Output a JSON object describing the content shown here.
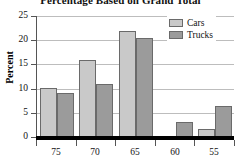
{
  "chart_data": {
    "type": "bar",
    "title": "Percentage Based on Grand Total",
    "xlabel": "",
    "ylabel": "Percent",
    "categories": [
      "75",
      "70",
      "65",
      "60",
      "55"
    ],
    "series": [
      {
        "name": "Cars",
        "color": "#c9c9c9",
        "values": [
          10.2,
          16.0,
          21.8,
          0.0,
          1.7
        ]
      },
      {
        "name": "Trucks",
        "color": "#9b9b9b",
        "values": [
          9.0,
          11.0,
          20.4,
          3.1,
          6.4
        ]
      }
    ],
    "ylim": [
      0,
      25
    ],
    "yticks": [
      0,
      5,
      10,
      15,
      20,
      25
    ],
    "ytick_labels": [
      "0",
      "5",
      "10",
      "15",
      "20",
      "25"
    ],
    "grid": true,
    "legend_position": "top-right"
  },
  "legend": {
    "items": [
      {
        "label": "Cars"
      },
      {
        "label": "Trucks"
      }
    ]
  }
}
